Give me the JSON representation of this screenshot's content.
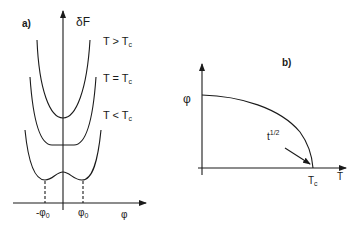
{
  "panel_a": {
    "label": "a)",
    "y_axis_label": "δF",
    "x_axis_label": "φ",
    "curves": [
      {
        "name": "T > Tc",
        "T": "T > T",
        "sub": "c"
      },
      {
        "name": "T = Tc",
        "T": "T = T",
        "sub": "c"
      },
      {
        "name": "T < Tc",
        "T": "T < T",
        "sub": "c"
      }
    ],
    "ticks": [
      {
        "main": "-φ",
        "sub": "0"
      },
      {
        "main": "φ",
        "sub": "0"
      }
    ]
  },
  "panel_b": {
    "label": "b)",
    "y_axis_label": "φ",
    "x_axis_label": "T",
    "tc_label": {
      "main": "T",
      "sub": "c"
    },
    "annotation": {
      "main": "t",
      "sup": "1/2"
    }
  },
  "colors": {
    "ink": "#1a1a1a",
    "background": "#ffffff"
  }
}
